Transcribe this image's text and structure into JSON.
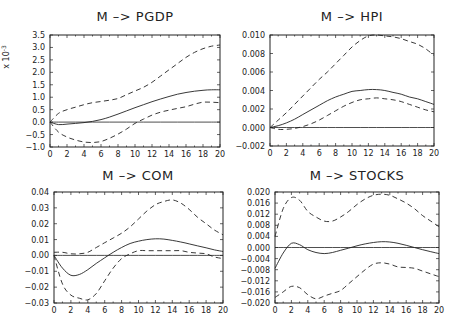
{
  "chart_data": [
    {
      "type": "line",
      "title": "M -> PGDP",
      "xlabel": "",
      "ylabel": "x 10^-3",
      "y_multiplier_label": "x 10",
      "y_multiplier_exp": "-3",
      "xlim": [
        0,
        20
      ],
      "ylim": [
        -1.0,
        3.5
      ],
      "xticks": [
        "0",
        "2",
        "4",
        "6",
        "8",
        "10",
        "12",
        "14",
        "16",
        "18",
        "20"
      ],
      "yticks": [
        "-1.0",
        "-0.5",
        "0.0",
        "0.5",
        "1.0",
        "1.5",
        "2.0",
        "2.5",
        "3.0",
        "3.5"
      ],
      "ytick_values": [
        -1.0,
        -0.5,
        0.0,
        0.5,
        1.0,
        1.5,
        2.0,
        2.5,
        3.0,
        3.5
      ],
      "x": [
        0,
        1,
        2,
        3,
        4,
        5,
        6,
        7,
        8,
        9,
        10,
        11,
        12,
        13,
        14,
        15,
        16,
        17,
        18,
        19,
        20
      ],
      "series": [
        {
          "name": "response",
          "style": "solid",
          "values": [
            0.0,
            -0.1,
            -0.08,
            -0.05,
            -0.02,
            0.03,
            0.1,
            0.2,
            0.32,
            0.45,
            0.58,
            0.7,
            0.82,
            0.93,
            1.03,
            1.12,
            1.19,
            1.24,
            1.28,
            1.3,
            1.3
          ]
        },
        {
          "name": "upper band",
          "style": "dashed",
          "values": [
            0.0,
            0.35,
            0.5,
            0.6,
            0.7,
            0.78,
            0.83,
            0.88,
            0.95,
            1.1,
            1.25,
            1.4,
            1.6,
            1.85,
            2.1,
            2.35,
            2.6,
            2.8,
            2.95,
            3.05,
            3.1
          ]
        },
        {
          "name": "lower band",
          "style": "dashed",
          "values": [
            0.0,
            -0.4,
            -0.6,
            -0.72,
            -0.8,
            -0.82,
            -0.78,
            -0.65,
            -0.48,
            -0.28,
            -0.05,
            0.12,
            0.28,
            0.4,
            0.48,
            0.55,
            0.62,
            0.72,
            0.8,
            0.8,
            0.78
          ]
        },
        {
          "name": "zero",
          "style": "solid",
          "values": [
            0,
            0,
            0,
            0,
            0,
            0,
            0,
            0,
            0,
            0,
            0,
            0,
            0,
            0,
            0,
            0,
            0,
            0,
            0,
            0,
            0
          ]
        }
      ]
    },
    {
      "type": "line",
      "title": "M -> HPI",
      "xlabel": "",
      "ylabel": "",
      "xlim": [
        0,
        20
      ],
      "ylim": [
        -0.002,
        0.01
      ],
      "xticks": [
        "0",
        "2",
        "4",
        "6",
        "8",
        "10",
        "12",
        "14",
        "16",
        "18",
        "20"
      ],
      "yticks": [
        "-0.002",
        "0.000",
        "0.002",
        "0.004",
        "0.006",
        "0.008",
        "0.010"
      ],
      "ytick_values": [
        -0.002,
        0.0,
        0.002,
        0.004,
        0.006,
        0.008,
        0.01
      ],
      "x": [
        0,
        1,
        2,
        3,
        4,
        5,
        6,
        7,
        8,
        9,
        10,
        11,
        12,
        13,
        14,
        15,
        16,
        17,
        18,
        19,
        20
      ],
      "series": [
        {
          "name": "response",
          "style": "solid",
          "values": [
            0.0,
            0.0002,
            0.0005,
            0.0009,
            0.0014,
            0.0019,
            0.0024,
            0.0029,
            0.0033,
            0.0036,
            0.0039,
            0.004,
            0.0041,
            0.0041,
            0.004,
            0.0038,
            0.0036,
            0.0033,
            0.0031,
            0.0028,
            0.0025
          ]
        },
        {
          "name": "upper band",
          "style": "dashed",
          "values": [
            0.0,
            0.0008,
            0.0016,
            0.0025,
            0.0034,
            0.0043,
            0.0052,
            0.006,
            0.0069,
            0.0078,
            0.0087,
            0.0094,
            0.0099,
            0.01,
            0.0099,
            0.0098,
            0.0096,
            0.0093,
            0.009,
            0.0085,
            0.0078
          ]
        },
        {
          "name": "lower band",
          "style": "dashed",
          "values": [
            0.0,
            -0.0002,
            -0.0002,
            -0.0001,
            0.0001,
            0.0004,
            0.0008,
            0.0013,
            0.0018,
            0.0023,
            0.0027,
            0.003,
            0.0031,
            0.0032,
            0.0031,
            0.003,
            0.0028,
            0.0025,
            0.0022,
            0.0019,
            0.0017
          ]
        },
        {
          "name": "zero",
          "style": "solid",
          "values": [
            0,
            0,
            0,
            0,
            0,
            0,
            0,
            0,
            0,
            0,
            0,
            0,
            0,
            0,
            0,
            0,
            0,
            0,
            0,
            0,
            0
          ]
        }
      ]
    },
    {
      "type": "line",
      "title": "M -> COM",
      "xlabel": "",
      "ylabel": "",
      "xlim": [
        0,
        20
      ],
      "ylim": [
        -0.03,
        0.04
      ],
      "xticks": [
        "0",
        "2",
        "4",
        "6",
        "8",
        "10",
        "12",
        "14",
        "16",
        "18",
        "20"
      ],
      "yticks": [
        "-0.03",
        "-0.02",
        "-0.01",
        "0.00",
        "0.01",
        "0.02",
        "0.03",
        "0.04"
      ],
      "ytick_values": [
        -0.03,
        -0.02,
        -0.01,
        0.0,
        0.01,
        0.02,
        0.03,
        0.04
      ],
      "x": [
        0,
        1,
        2,
        3,
        4,
        5,
        6,
        7,
        8,
        9,
        10,
        11,
        12,
        13,
        14,
        15,
        16,
        17,
        18,
        19,
        20
      ],
      "series": [
        {
          "name": "response",
          "style": "solid",
          "values": [
            0.0,
            -0.008,
            -0.0125,
            -0.012,
            -0.009,
            -0.005,
            -0.0015,
            0.002,
            0.005,
            0.0075,
            0.009,
            0.01,
            0.0105,
            0.0103,
            0.0095,
            0.0085,
            0.0073,
            0.006,
            0.0048,
            0.0035,
            0.0025
          ]
        },
        {
          "name": "upper band",
          "style": "dashed",
          "values": [
            0.002,
            0.002,
            0.001,
            0.001,
            0.002,
            0.005,
            0.008,
            0.011,
            0.014,
            0.018,
            0.023,
            0.028,
            0.032,
            0.034,
            0.035,
            0.033,
            0.029,
            0.024,
            0.02,
            0.016,
            0.013
          ]
        },
        {
          "name": "lower band",
          "style": "dashed",
          "values": [
            0.0,
            -0.018,
            -0.025,
            -0.027,
            -0.028,
            -0.024,
            -0.016,
            -0.008,
            -0.002,
            0.001,
            0.003,
            0.003,
            0.003,
            0.003,
            0.003,
            0.003,
            0.002,
            0.0015,
            0.001,
            -0.001,
            -0.002
          ]
        },
        {
          "name": "zero",
          "style": "solid",
          "values": [
            0,
            0,
            0,
            0,
            0,
            0,
            0,
            0,
            0,
            0,
            0,
            0,
            0,
            0,
            0,
            0,
            0,
            0,
            0,
            0,
            0
          ]
        }
      ]
    },
    {
      "type": "line",
      "title": "M -> STOCKS",
      "xlabel": "",
      "ylabel": "",
      "xlim": [
        0,
        20
      ],
      "ylim": [
        -0.02,
        0.02
      ],
      "xticks": [
        "0",
        "2",
        "4",
        "6",
        "8",
        "10",
        "12",
        "14",
        "16",
        "18",
        "20"
      ],
      "yticks": [
        "-0.020",
        "-0.016",
        "-0.012",
        "-0.008",
        "-0.004",
        "0.000",
        "0.004",
        "0.008",
        "0.012",
        "0.016",
        "0.020"
      ],
      "ytick_values": [
        -0.02,
        -0.016,
        -0.012,
        -0.008,
        -0.004,
        0.0,
        0.004,
        0.008,
        0.012,
        0.016,
        0.02
      ],
      "x": [
        0,
        1,
        2,
        3,
        4,
        5,
        6,
        7,
        8,
        9,
        10,
        11,
        12,
        13,
        14,
        15,
        16,
        17,
        18,
        19,
        20
      ],
      "series": [
        {
          "name": "response",
          "style": "solid",
          "values": [
            -0.0075,
            -0.002,
            0.0015,
            0.001,
            -0.0008,
            -0.0018,
            -0.0022,
            -0.0018,
            -0.001,
            -0.0002,
            0.0006,
            0.0013,
            0.0018,
            0.0021,
            0.002,
            0.0015,
            0.0008,
            0.0,
            -0.0008,
            -0.0015,
            -0.0022
          ]
        },
        {
          "name": "upper band",
          "style": "dashed",
          "values": [
            0.004,
            0.014,
            0.018,
            0.017,
            0.013,
            0.011,
            0.0095,
            0.0095,
            0.011,
            0.013,
            0.0155,
            0.0175,
            0.0188,
            0.0192,
            0.0188,
            0.0175,
            0.016,
            0.014,
            0.0115,
            0.0095,
            0.0075
          ]
        },
        {
          "name": "lower band",
          "style": "dashed",
          "values": [
            -0.018,
            -0.016,
            -0.014,
            -0.0145,
            -0.017,
            -0.0185,
            -0.0175,
            -0.0165,
            -0.0155,
            -0.013,
            -0.0105,
            -0.008,
            -0.006,
            -0.0055,
            -0.006,
            -0.007,
            -0.0072,
            -0.0075,
            -0.0085,
            -0.0095,
            -0.0105
          ]
        },
        {
          "name": "zero",
          "style": "solid",
          "values": [
            0,
            0,
            0,
            0,
            0,
            0,
            0,
            0,
            0,
            0,
            0,
            0,
            0,
            0,
            0,
            0,
            0,
            0,
            0,
            0,
            0
          ]
        }
      ]
    }
  ],
  "panels": [
    {
      "frame": {
        "x0": 50,
        "y0": 35,
        "x1": 220,
        "y1": 147
      },
      "title_x": 135,
      "title_y": 21,
      "ytick_fmt_x": 45
    },
    {
      "frame": {
        "x0": 270,
        "y0": 35,
        "x1": 434,
        "y1": 146
      },
      "title_x": 352,
      "title_y": 21,
      "ytick_fmt_x": 265
    },
    {
      "frame": {
        "x0": 54,
        "y0": 192,
        "x1": 223,
        "y1": 303
      },
      "title_x": 138,
      "title_y": 180,
      "ytick_fmt_x": 49
    },
    {
      "frame": {
        "x0": 275,
        "y0": 192,
        "x1": 439,
        "y1": 303
      },
      "title_x": 357,
      "title_y": 180,
      "ytick_fmt_x": 270
    }
  ]
}
